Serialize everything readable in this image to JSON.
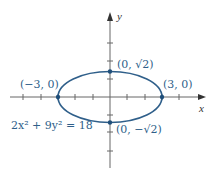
{
  "diagram": {
    "equation": "2x² + 9y² = 18",
    "axes": {
      "x_label": "x",
      "y_label": "y"
    },
    "points": [
      {
        "id": "left-vertex",
        "label": "(−3, 0)",
        "x": -3,
        "y": 0
      },
      {
        "id": "right-vertex",
        "label": "(3, 0)",
        "x": 3,
        "y": 0
      },
      {
        "id": "top-covertex",
        "label": "(0, √2)",
        "x": 0,
        "y": 1.414
      },
      {
        "id": "bottom-covertex",
        "label": "(0, −√2)",
        "x": 0,
        "y": -1.414
      }
    ],
    "ellipse": {
      "a": 3,
      "b": 1.414
    },
    "colors": {
      "curve": "#2f5f8a",
      "axis": "#555555",
      "label": "#2f5f8a"
    }
  }
}
